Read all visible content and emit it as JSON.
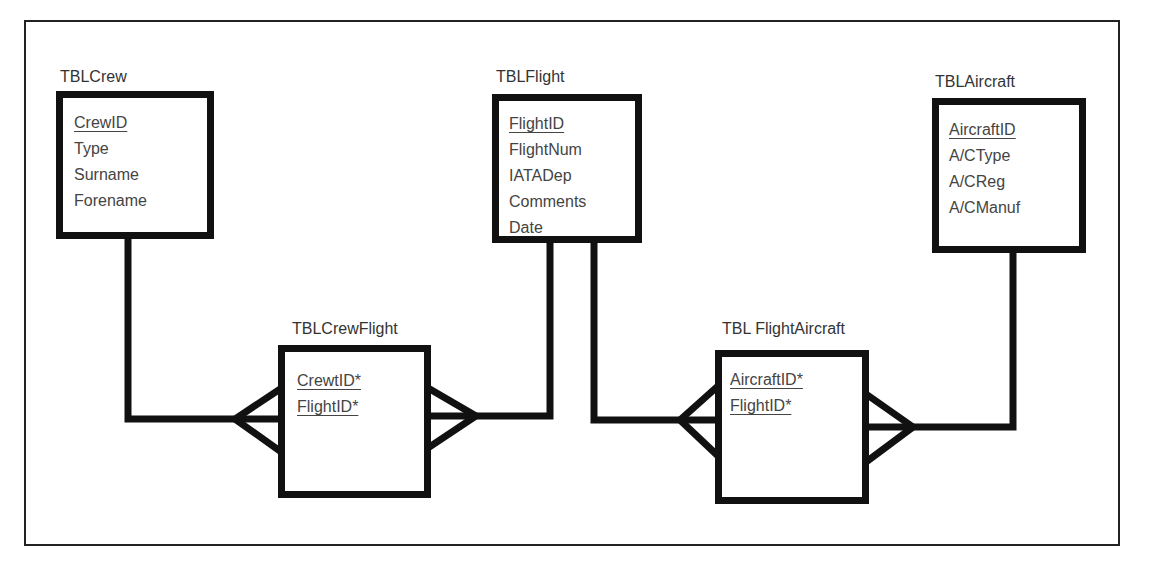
{
  "diagram": {
    "type": "entity-relationship",
    "entities": [
      {
        "id": "crew",
        "name": "TBLCrew",
        "attributes": [
          {
            "name": "CrewID",
            "key": true
          },
          {
            "name": "Type",
            "key": false
          },
          {
            "name": "Surname",
            "key": false
          },
          {
            "name": "Forename",
            "key": false
          }
        ]
      },
      {
        "id": "flight",
        "name": "TBLFlight",
        "attributes": [
          {
            "name": "FlightID",
            "key": true
          },
          {
            "name": "FlightNum",
            "key": false
          },
          {
            "name": "IATADep",
            "key": false
          },
          {
            "name": "Comments",
            "key": false
          },
          {
            "name": "Date",
            "key": false
          }
        ]
      },
      {
        "id": "aircraft",
        "name": "TBLAircraft",
        "attributes": [
          {
            "name": "AircraftID",
            "key": true
          },
          {
            "name": "A/CType",
            "key": false
          },
          {
            "name": "A/CReg",
            "key": false
          },
          {
            "name": "A/CManuf",
            "key": false
          }
        ]
      },
      {
        "id": "crewflight",
        "name": "TBLCrewFlight",
        "attributes": [
          {
            "name": "CrewtID*",
            "key": true
          },
          {
            "name": "FlightID*",
            "key": true
          }
        ]
      },
      {
        "id": "flightaircraft",
        "name": "TBL FlightAircraft",
        "attributes": [
          {
            "name": "AircraftID*",
            "key": true
          },
          {
            "name": "FlightID*",
            "key": true
          }
        ]
      }
    ],
    "relationships": [
      {
        "from": "TBLCrew",
        "to": "TBLCrewFlight",
        "cardinality": "one-to-many"
      },
      {
        "from": "TBLFlight",
        "to": "TBLCrewFlight",
        "cardinality": "one-to-many"
      },
      {
        "from": "TBLFlight",
        "to": "TBL FlightAircraft",
        "cardinality": "one-to-many"
      },
      {
        "from": "TBLAircraft",
        "to": "TBL FlightAircraft",
        "cardinality": "one-to-many"
      }
    ],
    "colors": {
      "line": "#111111",
      "text": "#444444",
      "background": "#ffffff"
    }
  }
}
